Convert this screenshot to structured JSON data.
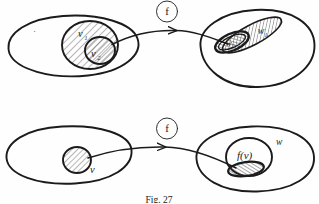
{
  "figure": {
    "caption": "Fig. 27",
    "background_color": "#fefefe",
    "ink_color": "#1b1b1b",
    "hatch_color": "#555555"
  },
  "panels": [
    {
      "id": "top",
      "name": "top-panel",
      "domain": {
        "name": "top-domain-ellipse",
        "label": "",
        "inner_sets": [
          {
            "label": "v",
            "subscript": "1",
            "name": "set-v1",
            "hatched": true
          },
          {
            "label": "v",
            "subscript": "2",
            "name": "set-v2",
            "hatched": true
          }
        ],
        "point_marker": "·"
      },
      "map": {
        "label": "f",
        "name": "map-arrow-top",
        "circled": true
      },
      "codomain": {
        "name": "top-codomain-ellipse",
        "label": "",
        "inner_sets": [
          {
            "label": "w",
            "subscript": "1",
            "name": "set-w1",
            "hatched": true
          },
          {
            "label": "w",
            "subscript": "2",
            "name": "set-w2",
            "hatched": true
          }
        ]
      }
    },
    {
      "id": "bottom",
      "name": "bottom-panel",
      "domain": {
        "name": "bottom-domain-ellipse",
        "label": "",
        "inner_sets": [
          {
            "label": "v",
            "subscript": "",
            "name": "set-v",
            "hatched": true
          }
        ]
      },
      "map": {
        "label": "f",
        "name": "map-arrow-bottom",
        "circled": true
      },
      "codomain": {
        "name": "bottom-codomain-ellipse",
        "label": "w",
        "inner_sets": [
          {
            "label": "f(v)",
            "subscript": "",
            "name": "set-fv",
            "hatched": true
          }
        ]
      }
    }
  ],
  "labels": {
    "v1": "v",
    "v1_sub": "1",
    "v2": "v",
    "v2_sub": "2",
    "w1": "w",
    "w1_sub": "1",
    "w2": "w",
    "w2_sub": "2",
    "v": "v",
    "w": "w",
    "fv": "f(v)",
    "f_top": "f",
    "f_bottom": "f",
    "dot": "·",
    "caption": "Fig. 27"
  }
}
